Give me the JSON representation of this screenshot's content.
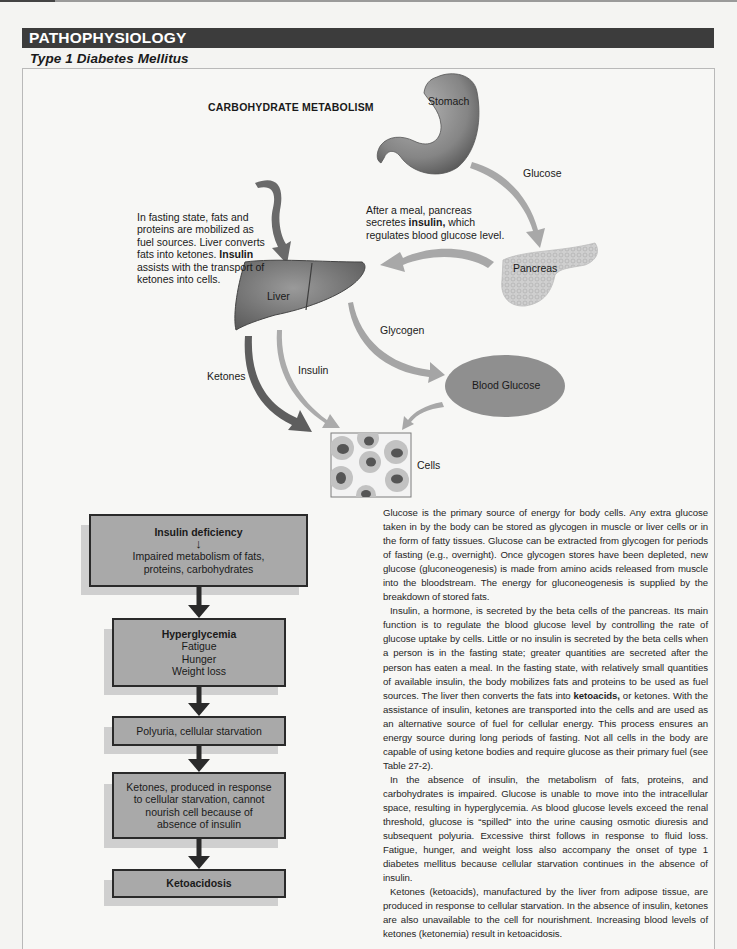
{
  "header": {
    "section_title": "PATHOPHYSIOLOGY",
    "subtitle": "Type 1 Diabetes Mellitus"
  },
  "diagram": {
    "title": "CARBOHYDRATE METABOLISM",
    "organs": {
      "stomach": "Stomach",
      "pancreas": "Pancreas",
      "liver": "Liver",
      "blood_glucose": "Blood Glucose",
      "cells": "Cells"
    },
    "arrow_labels": {
      "glucose": "Glucose",
      "glycogen": "Glycogen",
      "ketones": "Ketones",
      "insulin": "Insulin"
    },
    "meal_note": {
      "line1": "After a meal, pancreas",
      "line2_pre": "secretes ",
      "line2_bold": "insulin,",
      "line2_post": " which",
      "line3": "regulates blood glucose level."
    },
    "fasting_note": {
      "line1": "In fasting state, fats and",
      "line2": "proteins are mobilized as",
      "line3": "fuel sources. Liver converts",
      "line4_pre": "fats into ketones. ",
      "line4_bold": "Insulin",
      "line5": "assists with the transport of",
      "line6": "ketones into cells."
    },
    "colors": {
      "organ_fill": "#8a8a8a",
      "blood_glucose_fill": "#8d8d8d",
      "arrow_light": "#a9a9a9",
      "arrow_dark": "#5e5e5e"
    }
  },
  "flowchart": {
    "boxes": [
      {
        "title": "Insulin deficiency",
        "arrow": "↓",
        "lines": [
          "Impaired metabolism of fats,",
          "proteins, carbohydrates"
        ]
      },
      {
        "title": "Hyperglycemia",
        "lines": [
          "Fatigue",
          "Hunger",
          "Weight loss"
        ]
      },
      {
        "lines": [
          "Polyuria, cellular starvation"
        ]
      },
      {
        "lines": [
          "Ketones, produced in response",
          "to cellular starvation, cannot",
          "nourish cell because of",
          "absence of insulin"
        ]
      },
      {
        "title": "Ketoacidosis"
      }
    ]
  },
  "body": {
    "p1": "Glucose is the primary source of energy for body cells. Any extra glucose taken in by the body can be stored as glycogen in muscle or liver cells or in the form of fatty tissues. Glucose can be extracted from glycogen for periods of fasting (e.g., overnight). Once glycogen stores have been depleted, new glucose (gluco­neogenesis) is made from amino acids released from muscle into the blood­stream. The energy for gluconeogenesis is supplied by the breakdown of stored fats.",
    "p2_pre": "Insulin, a hormone, is secreted by the beta cells of the pancreas. Its main function is to regulate the blood glucose level by controlling the rate of glucose uptake by cells. Little or no insulin is secreted by the beta cells when a person is in the fasting state; greater quantities are secreted after the person has eaten a meal. In the fasting state, with relatively small quantities of available insulin, the body mobilizes fats and proteins to be used as fuel sources. The liver then converts the fats into ",
    "p2_bold": "ketoacids,",
    "p2_post": " or ketones. With the assistance of insulin, ketones are transported into the cells and are used as an alternative source of fuel for cellular energy. This process ensures an energy source during long periods of fasting. Not all cells in the body are capable of using ketone bodies and require glucose as their primary fuel (see Table 27-2).",
    "p3": "In the absence of insulin, the metabolism of fats, proteins, and carbohydrates is impaired. Glucose is unable to move into the intracellular space, resulting in hyperglycemia. As blood glucose levels exceed the renal threshold, glucose is “spilled” into the urine causing osmotic diuresis and subsequent polyuria. Exces­sive thirst follows in response to fluid loss. Fatigue, hunger, and weight loss also accompany the onset of type 1 diabetes mellitus because cellular starvation continues in the absence of insulin.",
    "p4": "Ketones (ketoacids), manufactured by the liver from adipose tissue, are pro­duced in response to cellular starvation. In the absence of insulin, ketones are also unavailable to the cell for nourishment. Increasing blood levels of ketones (ketonemia) result in ketoacidosis."
  }
}
